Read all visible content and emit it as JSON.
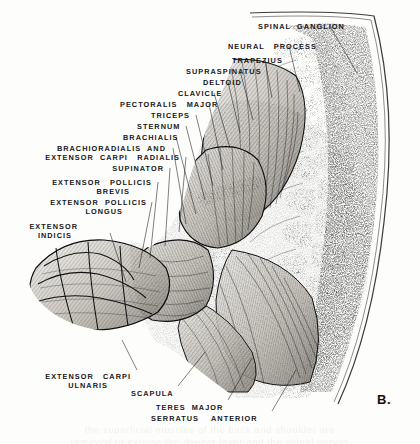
{
  "figure": {
    "plate_id": "B.",
    "style": "pen-and-ink anatomical engraving"
  },
  "ghost_text": {
    "line1": "the superficial muscles of the back and shoulder are",
    "line2": "removed to expose the deeper layer and the spinal nerves"
  },
  "labels": [
    {
      "id": "spinal-ganglion",
      "text": "SPINAL  GANGLION",
      "x": 258,
      "y": 22,
      "align": "left"
    },
    {
      "id": "neural-process",
      "text": "NEURAL   PROCESS",
      "x": 228,
      "y": 42,
      "align": "left"
    },
    {
      "id": "trapezius",
      "text": "TRAPEZIUS",
      "x": 232,
      "y": 56,
      "align": "left"
    },
    {
      "id": "supraspinatus",
      "text": "SUPRASPINATUS",
      "x": 186,
      "y": 67,
      "align": "left"
    },
    {
      "id": "deltoid",
      "text": "DELTOID",
      "x": 203,
      "y": 78,
      "align": "left"
    },
    {
      "id": "clavicle",
      "text": "CLAVICLE",
      "x": 178,
      "y": 89,
      "align": "left"
    },
    {
      "id": "pectoralis-major",
      "text": "PECTORALIS   MAJOR",
      "x": 120,
      "y": 100,
      "align": "left"
    },
    {
      "id": "triceps",
      "text": "TRICEPS",
      "x": 151,
      "y": 111,
      "align": "left"
    },
    {
      "id": "sternum",
      "text": "STERNUM",
      "x": 137,
      "y": 122,
      "align": "left"
    },
    {
      "id": "brachialis",
      "text": "BRACHIALIS",
      "x": 123,
      "y": 133,
      "align": "left"
    },
    {
      "id": "brachioradialis",
      "text": "BRACHIORADIALIS  AND",
      "x": 166,
      "y": 144,
      "align": "right"
    },
    {
      "id": "extensor-carpi-radialis",
      "text": "EXTENSOR  CARPI   RADIALIS",
      "x": 180,
      "y": 153,
      "align": "right"
    },
    {
      "id": "supinator",
      "text": "SUPINATOR",
      "x": 164,
      "y": 164,
      "align": "right"
    },
    {
      "id": "extensor-pollicis-brevis-1",
      "text": "EXTENSOR   POLLICIS",
      "x": 152,
      "y": 178,
      "align": "right"
    },
    {
      "id": "extensor-pollicis-brevis-2",
      "text": "BREVIS",
      "x": 130,
      "y": 187,
      "align": "right"
    },
    {
      "id": "extensor-pollicis-longus-1",
      "text": "EXTENSOR  POLLICIS",
      "x": 147,
      "y": 198,
      "align": "right"
    },
    {
      "id": "extensor-pollicis-longus-2",
      "text": "LONGUS",
      "x": 123,
      "y": 207,
      "align": "right"
    },
    {
      "id": "extensor-indicis-1",
      "text": "EXTENSOR",
      "x": 78,
      "y": 222,
      "align": "right"
    },
    {
      "id": "extensor-indicis-2",
      "text": "INDICIS",
      "x": 72,
      "y": 231,
      "align": "right"
    },
    {
      "id": "extensor-carpi-ulnaris-1",
      "text": "EXTENSOR   CARPI",
      "x": 131,
      "y": 372,
      "align": "right"
    },
    {
      "id": "extensor-carpi-ulnaris-2",
      "text": "ULNARIS",
      "x": 108,
      "y": 381,
      "align": "right"
    },
    {
      "id": "scapula",
      "text": "SCAPULA",
      "x": 131,
      "y": 389,
      "align": "left"
    },
    {
      "id": "teres-major",
      "text": "TERES  MAJOR",
      "x": 156,
      "y": 403,
      "align": "left"
    },
    {
      "id": "serratus-anterior",
      "text": "SERRATUS    ANTERIOR",
      "x": 151,
      "y": 414,
      "align": "left"
    }
  ],
  "leader_lines": [
    {
      "id": "leader-spinal-ganglion",
      "x1": 330,
      "y1": 26,
      "x2": 357,
      "y2": 73
    },
    {
      "id": "leader-neural-process",
      "x1": 289,
      "y1": 46,
      "x2": 300,
      "y2": 92
    },
    {
      "id": "leader-trapezius",
      "x1": 265,
      "y1": 60,
      "x2": 272,
      "y2": 98
    },
    {
      "id": "leader-supraspinatus",
      "x1": 240,
      "y1": 71,
      "x2": 253,
      "y2": 120
    },
    {
      "id": "leader-deltoid",
      "x1": 228,
      "y1": 82,
      "x2": 240,
      "y2": 133
    },
    {
      "id": "leader-clavicle",
      "x1": 214,
      "y1": 93,
      "x2": 230,
      "y2": 148
    },
    {
      "id": "leader-pectoralis-major",
      "x1": 209,
      "y1": 104,
      "x2": 223,
      "y2": 170
    },
    {
      "id": "leader-triceps",
      "x1": 196,
      "y1": 115,
      "x2": 213,
      "y2": 186
    },
    {
      "id": "leader-sternum",
      "x1": 186,
      "y1": 126,
      "x2": 205,
      "y2": 200
    },
    {
      "id": "leader-brachialis",
      "x1": 176,
      "y1": 137,
      "x2": 196,
      "y2": 214
    },
    {
      "id": "leader-brachioradialis",
      "x1": 173,
      "y1": 148,
      "x2": 186,
      "y2": 224
    },
    {
      "id": "leader-extensor-carpi-radialis",
      "x1": 186,
      "y1": 157,
      "x2": 179,
      "y2": 232
    },
    {
      "id": "leader-supinator",
      "x1": 170,
      "y1": 168,
      "x2": 165,
      "y2": 246
    },
    {
      "id": "leader-extensor-pollicis-brevis",
      "x1": 158,
      "y1": 182,
      "x2": 150,
      "y2": 258
    },
    {
      "id": "leader-extensor-pollicis-longus",
      "x1": 152,
      "y1": 202,
      "x2": 139,
      "y2": 268
    },
    {
      "id": "leader-extensor-indicis",
      "x1": 110,
      "y1": 233,
      "x2": 126,
      "y2": 282
    },
    {
      "id": "leader-extensor-carpi-ulnaris",
      "x1": 137,
      "y1": 370,
      "x2": 122,
      "y2": 340
    },
    {
      "id": "leader-scapula",
      "x1": 178,
      "y1": 386,
      "x2": 205,
      "y2": 352
    },
    {
      "id": "leader-teres-major",
      "x1": 228,
      "y1": 400,
      "x2": 252,
      "y2": 358
    },
    {
      "id": "leader-serratus-anterior",
      "x1": 272,
      "y1": 411,
      "x2": 296,
      "y2": 370
    }
  ]
}
